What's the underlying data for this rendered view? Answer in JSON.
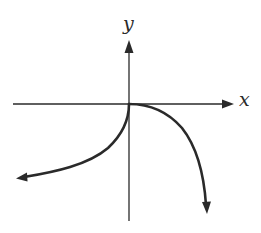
{
  "figure": {
    "type": "function-graph",
    "axes": {
      "x_label": "x",
      "y_label": "y",
      "color": "#2a2a2a"
    },
    "curves": [
      {
        "name": "left-branch",
        "description": "Starts at origin, vertical tangent, curves down and to the left, ends with arrow",
        "from": "origin",
        "direction": "down-left",
        "arrow_end": true
      },
      {
        "name": "right-branch",
        "description": "Starts at origin, horizontal tangent, curves down and to the right steeply, ends with arrow",
        "from": "origin",
        "direction": "down-right",
        "arrow_end": true
      }
    ],
    "background": "#ffffff"
  }
}
